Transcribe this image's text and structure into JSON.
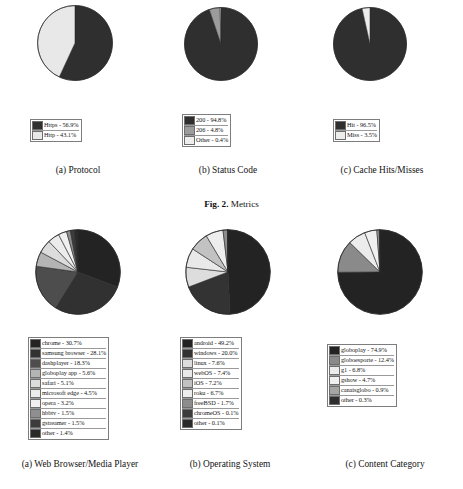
{
  "figure": {
    "caption_bold": "Fig. 2.",
    "caption_rest": " Metrics"
  },
  "palette": {
    "ink": "#2b2b2b",
    "very_dark": "#242424",
    "dark": "#3a3a3a",
    "mid_dark": "#5a5a5a",
    "mid": "#808080",
    "mid_light": "#a8a8a8",
    "light": "#c9c9c9",
    "very_light": "#e2e2e2",
    "white": "#f2f2f2",
    "outline": "#6d6d6d"
  },
  "charts": [
    {
      "id": "protocol",
      "subcaption": "(a) Protocol",
      "chart_data": {
        "type": "pie",
        "title": "Protocol",
        "start_angle_deg": 0,
        "direction": "clockwise",
        "categories": [
          "Https",
          "Http"
        ],
        "values": [
          56.9,
          43.1
        ],
        "labels": [
          "Https - 56.9%",
          "Http - 43.1%"
        ],
        "colors": [
          "#2f2f2f",
          "#e8e8e8"
        ],
        "legend_position": "bottom"
      }
    },
    {
      "id": "status-code",
      "subcaption": "(b) Status Code",
      "chart_data": {
        "type": "pie",
        "title": "Status Code",
        "start_angle_deg": 0,
        "direction": "clockwise",
        "categories": [
          "200",
          "206",
          "Other"
        ],
        "values": [
          94.8,
          4.8,
          0.4
        ],
        "labels": [
          "200 - 94.8%",
          "206 - 4.8%",
          "Other - 0.4%"
        ],
        "colors": [
          "#2f2f2f",
          "#9c9c9c",
          "#ededed"
        ],
        "legend_position": "bottom"
      }
    },
    {
      "id": "cache-hits-misses",
      "subcaption": "(c) Cache Hits/Misses",
      "chart_data": {
        "type": "pie",
        "title": "Cache Hits/Misses",
        "start_angle_deg": 0,
        "direction": "clockwise",
        "categories": [
          "Hit",
          "Miss"
        ],
        "values": [
          96.5,
          3.5
        ],
        "labels": [
          "Hit - 96.5%",
          "Miss - 3.5%"
        ],
        "colors": [
          "#2f2f2f",
          "#ededed"
        ],
        "legend_position": "bottom"
      }
    },
    {
      "id": "web-browser-media-player",
      "subcaption": "(a) Web Browser/Media Player",
      "chart_data": {
        "type": "pie",
        "title": "Web Browser/Media Player",
        "start_angle_deg": 0,
        "direction": "clockwise",
        "categories": [
          "chrome",
          "samsung browser",
          "dashplayer",
          "globoplay app",
          "safari",
          "microsoft edge",
          "opera",
          "hbbtv",
          "gstreamer",
          "other"
        ],
        "values": [
          30.7,
          28.1,
          18.3,
          5.6,
          5.1,
          4.5,
          3.2,
          1.5,
          1.5,
          1.4
        ],
        "labels": [
          "chrome - 30.7%",
          "samsung browser - 28.1%",
          "dashplayer - 18.3%",
          "globoplay app - 5.6%",
          "safari - 5.1%",
          "microsoft edge - 4.5%",
          "opera - 3.2%",
          "hbbtv - 1.5%",
          "gstreamer - 1.5%",
          "other - 1.4%"
        ],
        "colors": [
          "#232323",
          "#313131",
          "#4d4d4d",
          "#b4b4b4",
          "#dcdcdc",
          "#ececec",
          "#f0f0f0",
          "#8f8f8f",
          "#3c3c3c",
          "#2a2a2a"
        ],
        "legend_position": "bottom"
      }
    },
    {
      "id": "operating-system",
      "subcaption": "(b) Operating System",
      "chart_data": {
        "type": "pie",
        "title": "Operating System",
        "start_angle_deg": 0,
        "direction": "clockwise",
        "categories": [
          "android",
          "windows",
          "linux",
          "webOS",
          "iOS",
          "roku",
          "freeBSD",
          "chromeOS",
          "other"
        ],
        "values": [
          49.2,
          20.0,
          7.6,
          7.4,
          7.2,
          6.7,
          1.7,
          0.1,
          0.1
        ],
        "labels": [
          "android - 49.2%",
          "windows - 20.0%",
          "linux - 7.6%",
          "webOS - 7.4%",
          "iOS - 7.2%",
          "roku - 6.7%",
          "freeBSD - 1.7%",
          "chromeOS - 0.1%",
          "other - 0.1%"
        ],
        "colors": [
          "#232323",
          "#333333",
          "#dddddd",
          "#e9e9e9",
          "#c2c2c2",
          "#ededed",
          "#8d8d8d",
          "#3c3c3c",
          "#2a2a2a"
        ],
        "legend_position": "bottom"
      }
    },
    {
      "id": "content-category",
      "subcaption": "(c) Content Category",
      "chart_data": {
        "type": "pie",
        "title": "Content Category",
        "start_angle_deg": 0,
        "direction": "clockwise",
        "categories": [
          "globoplay",
          "globoesporte",
          "g1",
          "gshow",
          "canaisglobo",
          "other"
        ],
        "values": [
          74.9,
          12.4,
          6.8,
          4.7,
          0.9,
          0.3
        ],
        "labels": [
          "globoplay - 74.9%",
          "globoesporte - 12.4%",
          "g1 - 6.8%",
          "gshow - 4.7%",
          "canaisglobo - 0.9%",
          "other - 0.3%"
        ],
        "colors": [
          "#232323",
          "#8a8a8a",
          "#ececec",
          "#f0f0f0",
          "#a5a5a5",
          "#2e2e2e"
        ],
        "legend_position": "bottom"
      }
    }
  ]
}
